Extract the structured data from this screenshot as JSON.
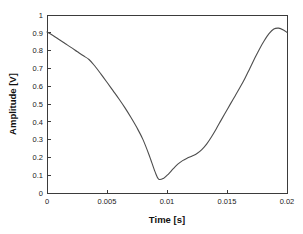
{
  "chart_data": {
    "type": "line",
    "title": "",
    "xlabel": "Time [s]",
    "ylabel": "Amplitude [V]",
    "xlim": [
      0,
      0.02
    ],
    "ylim": [
      0,
      1
    ],
    "grid": false,
    "legend": null,
    "xticks": [
      0,
      0.005,
      0.01,
      0.015,
      0.02
    ],
    "xticklabels": [
      "0",
      "0.005",
      "0.01",
      "0.015",
      "0.02"
    ],
    "yticks": [
      0,
      0.1,
      0.2,
      0.3,
      0.4,
      0.5,
      0.6,
      0.7,
      0.8,
      0.9,
      1
    ],
    "yticklabels": [
      "0",
      "0.1",
      "0.2",
      "0.3",
      "0.4",
      "0.5",
      "0.6",
      "0.7",
      "0.8",
      "0.9",
      "1"
    ],
    "line_color": "#4d4d4d",
    "axis_color": "#3b3b3b",
    "background_color": "#ffffff",
    "series": [
      {
        "name": "amplitude",
        "x": [
          0.0,
          0.0005,
          0.001,
          0.0015,
          0.002,
          0.0025,
          0.003,
          0.0035,
          0.004,
          0.0045,
          0.005,
          0.0055,
          0.006,
          0.0065,
          0.007,
          0.0075,
          0.008,
          0.0085,
          0.009,
          0.0093,
          0.0097,
          0.0101,
          0.0105,
          0.0109,
          0.0113,
          0.0117,
          0.0121,
          0.0125,
          0.0129,
          0.0133,
          0.0137,
          0.0141,
          0.0145,
          0.0149,
          0.0153,
          0.0157,
          0.0161,
          0.0165,
          0.0169,
          0.0173,
          0.0177,
          0.0181,
          0.0185,
          0.0189,
          0.0193,
          0.0197,
          0.02
        ],
        "y": [
          0.905,
          0.885,
          0.862,
          0.84,
          0.818,
          0.795,
          0.772,
          0.75,
          0.712,
          0.668,
          0.622,
          0.575,
          0.528,
          0.478,
          0.424,
          0.366,
          0.3,
          0.215,
          0.12,
          0.078,
          0.082,
          0.105,
          0.135,
          0.162,
          0.182,
          0.196,
          0.208,
          0.222,
          0.244,
          0.275,
          0.315,
          0.36,
          0.408,
          0.455,
          0.502,
          0.548,
          0.595,
          0.645,
          0.7,
          0.755,
          0.808,
          0.855,
          0.895,
          0.921,
          0.926,
          0.916,
          0.902
        ]
      }
    ],
    "annotations": {
      "minimum": {
        "x": 0.0093,
        "y": 0.078
      },
      "maximum": {
        "x": 0.0193,
        "y": 0.926
      },
      "start": {
        "x": 0.0,
        "y": 0.905
      },
      "end": {
        "x": 0.02,
        "y": 0.902
      }
    }
  }
}
